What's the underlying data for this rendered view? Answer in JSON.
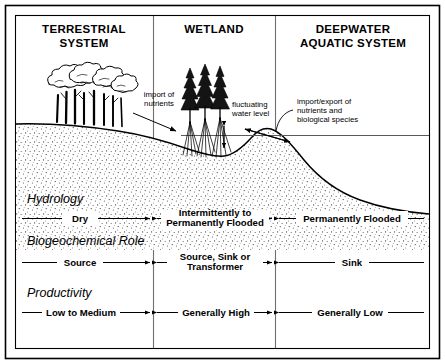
{
  "figure": {
    "kind": "wetland-zonation-diagram",
    "border_color": "#000000",
    "background": "#ffffff",
    "line_color": "#000000"
  },
  "columns": [
    {
      "id": "terrestrial",
      "title_line1": "TERRESTRIAL",
      "title_line2": "SYSTEM"
    },
    {
      "id": "wetland",
      "title_line1": "WETLAND",
      "title_line2": ""
    },
    {
      "id": "deepwater",
      "title_line1": "DEEPWATER",
      "title_line2": "AQUATIC SYSTEM"
    }
  ],
  "annotations": [
    {
      "id": "import-nutrients",
      "line1": "import of",
      "line2": "nutrients",
      "line3": ""
    },
    {
      "id": "fluctuating-water-level",
      "line1": "fluctuating",
      "line2": "water level",
      "line3": ""
    },
    {
      "id": "import-export",
      "line1": "import/export of",
      "line2": "nutrients and",
      "line3": "biological species"
    }
  ],
  "rows": [
    {
      "id": "hydrology",
      "label": "Hydrology",
      "cells": [
        {
          "col": "terrestrial",
          "line1": "Dry",
          "line2": ""
        },
        {
          "col": "wetland",
          "line1": "Intermittently to",
          "line2": "Permanently Flooded"
        },
        {
          "col": "deepwater",
          "line1": "Permanently Flooded",
          "line2": ""
        }
      ]
    },
    {
      "id": "biogeochemical-role",
      "label": "Biogeochemical Role",
      "cells": [
        {
          "col": "terrestrial",
          "line1": "Source",
          "line2": ""
        },
        {
          "col": "wetland",
          "line1": "Source, Sink or",
          "line2": "Transformer"
        },
        {
          "col": "deepwater",
          "line1": "Sink",
          "line2": ""
        }
      ]
    },
    {
      "id": "productivity",
      "label": "Productivity",
      "cells": [
        {
          "col": "terrestrial",
          "line1": "Low to Medium",
          "line2": ""
        },
        {
          "col": "wetland",
          "line1": "Generally High",
          "line2": ""
        },
        {
          "col": "deepwater",
          "line1": "Generally Low",
          "line2": ""
        }
      ]
    }
  ],
  "scene": {
    "terrestrial_vegetation": "deciduous-tree-cluster",
    "wetland_vegetation": "conifer-cluster-on-stilt-roots",
    "ground_label": "soil-substrate-profile",
    "water_label": "water-surface-line"
  }
}
